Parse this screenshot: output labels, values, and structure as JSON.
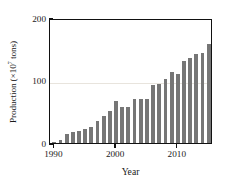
{
  "chart_data": {
    "type": "bar",
    "title": "",
    "xlabel": "Year",
    "ylabel": "Production (×10⁷ tons)",
    "ylabel_prefix": "Production (×10",
    "ylabel_exponent": "7",
    "ylabel_suffix": " tons)",
    "bar_color": "#767676",
    "frame_color": "#111111",
    "grid": "horizontal-faint-at-100",
    "legend": "none",
    "xlim": [
      1989.3,
      2015.7
    ],
    "ylim": [
      0,
      200
    ],
    "ytick_labels": [
      "0",
      "100",
      "200"
    ],
    "ytick_values": [
      0,
      100,
      200
    ],
    "xtick_labels": [
      "1990",
      "2000",
      "2010"
    ],
    "xtick_values": [
      1990,
      2000,
      2010
    ],
    "categories": [
      1990,
      1991,
      1992,
      1993,
      1994,
      1995,
      1996,
      1997,
      1998,
      1999,
      2000,
      2001,
      2002,
      2003,
      2004,
      2005,
      2006,
      2007,
      2008,
      2009,
      2010,
      2011,
      2012,
      2013,
      2014,
      2015
    ],
    "values": [
      1,
      5,
      14,
      17,
      19,
      22,
      26,
      35,
      43,
      51,
      68,
      58,
      58,
      70,
      71,
      71,
      93,
      95,
      103,
      113,
      110,
      131,
      136,
      143,
      144,
      159
    ]
  }
}
